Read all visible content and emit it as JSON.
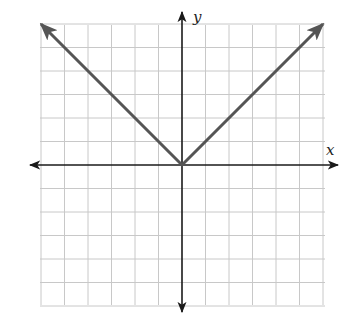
{
  "chart_data": {
    "type": "line",
    "title": "",
    "xlabel": "x",
    "ylabel": "y",
    "function": "y = |x|",
    "xlim": [
      -6,
      6
    ],
    "ylim": [
      -6,
      6
    ],
    "grid": true,
    "grid_step": 1,
    "tick_labels": false,
    "series": [
      {
        "name": "y = |x|",
        "x": [
          -6,
          -5,
          -4,
          -3,
          -2,
          -1,
          0,
          1,
          2,
          3,
          4,
          5,
          6
        ],
        "y": [
          6,
          5,
          4,
          3,
          2,
          1,
          0,
          1,
          2,
          3,
          4,
          5,
          6
        ],
        "vertex": [
          0,
          0
        ],
        "arrows_at_ends": true,
        "color": "#555555"
      }
    ],
    "legend": null
  },
  "colors": {
    "grid": "#c8c8c8",
    "axis": "#1a1a1a",
    "curve": "#555555",
    "background": "#ffffff"
  },
  "labels": {
    "x_axis": "x",
    "y_axis": "y"
  }
}
